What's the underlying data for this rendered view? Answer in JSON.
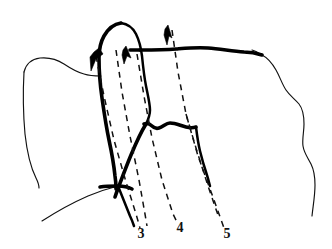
{
  "figure": {
    "background_color": "#ffffff",
    "ink_color": "#111111",
    "width": 332,
    "height": 249,
    "labels": [
      {
        "id": "label-3",
        "text": "3",
        "x": 141,
        "y": 238
      },
      {
        "id": "label-4",
        "text": "4",
        "x": 180,
        "y": 232
      },
      {
        "id": "label-5",
        "text": "5",
        "x": 227,
        "y": 238
      }
    ],
    "dashed_lines": [
      {
        "id": "dashed-line-3",
        "label": "3",
        "path": "M 96 56 L 104 96 L 114 140 L 126 182 L 136 214 L 140 228"
      },
      {
        "id": "dashed-line-3b",
        "label": "3",
        "path": "M 116 50 L 122 92 L 130 136 L 139 180 L 145 214 L 147 226"
      },
      {
        "id": "dashed-line-4",
        "label": "4",
        "path": "M 137 54 L 144 96 L 152 138 L 162 180 L 173 214 L 178 224"
      },
      {
        "id": "dashed-line-5",
        "label": "5",
        "path": "M 172 30 L 178 72 L 186 114 L 198 156 L 214 200 L 224 228"
      },
      {
        "id": "dashed-line-5b",
        "label": "5",
        "path": "M 186 114 L 196 148 L 208 186 L 219 218"
      }
    ],
    "arrows": [
      {
        "id": "arrow-left-down",
        "direction": "down-left",
        "tip_x": 91,
        "tip_y": 70
      },
      {
        "id": "arrow-middle-up",
        "direction": "up",
        "tip_x": 126,
        "tip_y": 48
      },
      {
        "id": "arrow-right-up",
        "direction": "up",
        "tip_x": 168,
        "tip_y": 27
      }
    ],
    "contours": [
      {
        "id": "outer-left-contour",
        "weight": "thin"
      },
      {
        "id": "outer-right-contour",
        "weight": "thin"
      },
      {
        "id": "lower-left-contour",
        "weight": "thin"
      },
      {
        "id": "central-body-contour",
        "weight": "bold"
      },
      {
        "id": "top-ridge-contour",
        "weight": "bold"
      },
      {
        "id": "lower-central-contour",
        "weight": "bold"
      },
      {
        "id": "right-descending-contour",
        "weight": "medium"
      }
    ]
  }
}
